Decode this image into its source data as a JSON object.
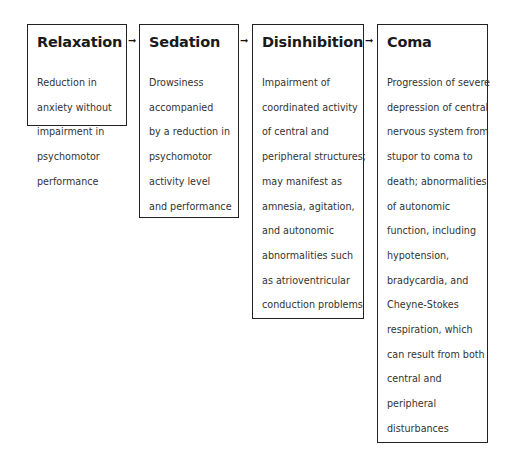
{
  "diagram": {
    "type": "flow",
    "direction": "left-to-right",
    "stages": [
      {
        "title": "Relaxation",
        "lines": [
          "Reduction in",
          "anxiety without",
          "impairment in",
          "psychomotor",
          "performance"
        ]
      },
      {
        "title": "Sedation",
        "lines": [
          "Drowsiness",
          "accompanied",
          "by a reduction in",
          "psychomotor",
          "activity level",
          "and performance"
        ]
      },
      {
        "title": "Disinhibition",
        "lines": [
          "Impairment of",
          "coordinated activity",
          "of central and",
          "peripheral structures;",
          "may manifest as",
          "amnesia, agitation,",
          "and autonomic",
          "abnormalities such",
          "as atrioventricular",
          "conduction problems"
        ]
      },
      {
        "title": "Coma",
        "lines": [
          "Progression of severe",
          "depression of central",
          "nervous system from",
          "stupor to coma to",
          "death; abnormalities",
          "of autonomic",
          "function, including",
          "hypotension,",
          "bradycardia, and",
          "Cheyne-Stokes",
          "respiration, which",
          "can result from both",
          "central and",
          "peripheral",
          "disturbances"
        ]
      }
    ],
    "arrows": [
      "➞",
      "➞",
      "➞"
    ]
  }
}
